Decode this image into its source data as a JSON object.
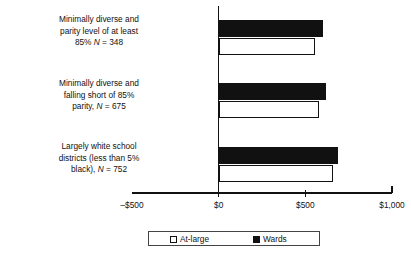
{
  "chart_data": {
    "type": "bar",
    "orientation": "horizontal",
    "title": "",
    "xlabel": "",
    "ylabel": "",
    "xlim": [
      -500,
      1000
    ],
    "xticks": [
      -500,
      0,
      500,
      1000
    ],
    "xticklabels": [
      "–$500",
      "$0",
      "$500",
      "$1,000"
    ],
    "grid": false,
    "legend_position": "bottom",
    "categories": [
      "Minimally diverse and parity level of at least 85% N = 348",
      "Minimally diverse and falling short of 85% parity, N = 675",
      "Largely white school districts (less than 5% black), N = 752"
    ],
    "series": [
      {
        "name": "At-large",
        "values": [
          553,
          580,
          660
        ],
        "fill": "#ffffff",
        "edge": "#111111"
      },
      {
        "name": "Wards",
        "values": [
          600,
          617,
          686
        ],
        "fill": "#111111",
        "edge": "#111111"
      }
    ]
  },
  "labels": [
    {
      "line1": "Minimally diverse and",
      "line2": "parity level of at least",
      "line3a": "85% ",
      "line3i": "N",
      "line3b": " = 348"
    },
    {
      "line1": "Minimally diverse and",
      "line2": "falling short of 85%",
      "line3a": "parity, ",
      "line3i": "N",
      "line3b": " = 675"
    },
    {
      "line1": "Largely white school",
      "line2": "districts (less than 5%",
      "line3a": "black), ",
      "line3i": "N",
      "line3b": " = 752"
    }
  ],
  "axis": {
    "tick_labels": [
      "–$500",
      "$0",
      "$500",
      "$1,000"
    ]
  },
  "legend": {
    "items": [
      {
        "label": "At-large",
        "style": "open"
      },
      {
        "label": "Wards",
        "style": "filled"
      }
    ]
  },
  "note": {
    "text": ""
  }
}
